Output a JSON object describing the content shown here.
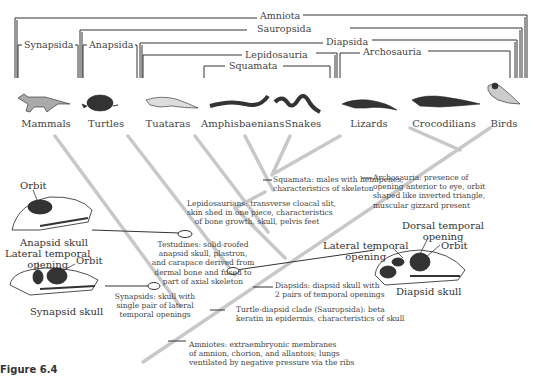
{
  "figure": {
    "label": "Figure 6.4"
  },
  "clades": {
    "amniota": "Amniota",
    "sauropsida": "Sauropsida",
    "synapsida": "Synapsida",
    "anapsida": "Anapsida",
    "diapsida": "Diapsida",
    "lepidosauria": "Lepidosauria",
    "archosauria": "Archosauria",
    "squamata": "Squamata"
  },
  "taxa": [
    {
      "name": "Mammals",
      "icon": "fox-icon"
    },
    {
      "name": "Turtles",
      "icon": "turtle-icon"
    },
    {
      "name": "Tuataras",
      "icon": "tuatara-icon"
    },
    {
      "name": "Amphisbaenians",
      "icon": "amphisbaenian-icon"
    },
    {
      "name": "Snakes",
      "icon": "snake-icon"
    },
    {
      "name": "Lizards",
      "icon": "lizard-icon"
    },
    {
      "name": "Crocodilians",
      "icon": "crocodile-icon"
    },
    {
      "name": "Birds",
      "icon": "bird-icon"
    }
  ],
  "notes": {
    "squamata": "Squamata: males with hemipenes,\ncharacteristics of skeleton",
    "archosauria": "Archosauria: presence of\nopening anterior to eye, orbit\nshaped like inverted triangle,\nmuscular gizzard present",
    "lepidosaurians": "Lepidosaurians: transverse cloacal slit,\nskin shed in one piece, characteristics\nof bone growth, skull, pelvis feet",
    "testudines": "Testudines: solid-roofed\nanapsid skull, plastron,\nand carapace derived from\ndermal bone and fused to\npart of axial skeleton",
    "diapsids": "Diapsids: diapsid skull with\n2 pairs of temporal openings",
    "synapsids": "Synapsids: skull with\nsingle pair of lateral\ntemporal openings",
    "turtle_diapsid": "Turtle-diapsid clade (Sauropsida): beta\nkeratin in epidermis, characteristics of skull",
    "amniotes": "Amniotes: extraembryonic membranes\nof amnion, chorion, and allantois; lungs\nventilated by negative pressure via the ribs"
  },
  "skulls": {
    "anapsid": {
      "orbit": "Orbit",
      "caption": "Anapsid skull"
    },
    "synapsid": {
      "lateral": "Lateral temporal\nopening",
      "orbit": "Orbit",
      "caption": "Synapsid skull"
    },
    "diapsid": {
      "dorsal": "Dorsal temporal\nopening",
      "lateral": "Lateral temporal\nopening",
      "orbit": "Orbit",
      "caption": "Diapsid skull"
    }
  }
}
